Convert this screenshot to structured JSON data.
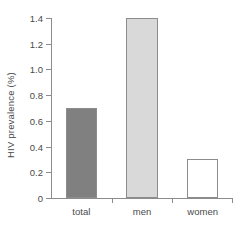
{
  "chart_data": {
    "type": "bar",
    "title": "",
    "subtitle": "",
    "xlabel": "",
    "ylabel": "HIV prevalence (%)",
    "categories": [
      "total",
      "men",
      "women"
    ],
    "values": [
      0.7,
      1.4,
      0.3
    ],
    "series": [
      {
        "name": "HIV prevalence",
        "values": [
          0.7,
          1.4,
          0.3
        ]
      }
    ],
    "bar_colors": [
      "#808080",
      "#d9d9d9",
      "#ffffff"
    ],
    "bar_edge_color": "#8c8c8c",
    "ylim": [
      0,
      1.4
    ],
    "yticks": [
      0,
      0.2,
      0.4,
      0.6,
      0.8,
      1.0,
      1.2,
      1.4
    ],
    "ytick_labels": [
      "0",
      "0.2",
      "0.4",
      "0.6",
      "0.8",
      "1.0",
      "1.2",
      "1.4"
    ],
    "grid": false,
    "legend": null,
    "annotations": [],
    "axis_color": "#8c8c8c",
    "text_color": "#4a4a4a",
    "background": "#ffffff"
  }
}
